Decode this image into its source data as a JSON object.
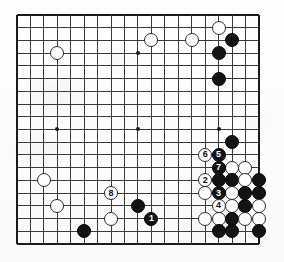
{
  "figure": {
    "type": "go-board-diagram",
    "board_size": 19,
    "visible_columns": 19,
    "visible_rows": 19,
    "colors": {
      "black_stone": "#131313",
      "white_stone": "#fdfdfd",
      "grid_line": "#3a3a3a",
      "board_edge": "#1a1a1a",
      "paper": "#fbfbfa"
    },
    "geometry": {
      "origin_x": 17,
      "origin_y": 15,
      "step_x": 13.44,
      "step_y": 12.72,
      "stone_diameter": 14
    },
    "star_points": [
      {
        "col": 3,
        "row": 3
      },
      {
        "col": 9,
        "row": 3
      },
      {
        "col": 15,
        "row": 3
      },
      {
        "col": 3,
        "row": 9
      },
      {
        "col": 9,
        "row": 9
      },
      {
        "col": 15,
        "row": 9
      },
      {
        "col": 3,
        "row": 15
      },
      {
        "col": 9,
        "row": 15
      },
      {
        "col": 15,
        "row": 15
      }
    ]
  },
  "move_numbers": {
    "1": "1",
    "2": "2",
    "3": "3",
    "4": "4",
    "5": "5",
    "6": "6",
    "7": "7",
    "8": "8"
  },
  "chart_data": {
    "type": "table",
    "xlabel": "column (0–18, left to right)",
    "ylabel": "row (0–18, top to bottom)",
    "legend": [
      "black stone",
      "white stone",
      "numbered move"
    ],
    "stones": [
      {
        "col": 3,
        "row": 3,
        "color": "white",
        "label": ""
      },
      {
        "col": 10,
        "row": 2,
        "color": "white",
        "label": ""
      },
      {
        "col": 13,
        "row": 2,
        "color": "white",
        "label": ""
      },
      {
        "col": 15,
        "row": 1,
        "color": "white",
        "label": ""
      },
      {
        "col": 16,
        "row": 2,
        "color": "black",
        "label": ""
      },
      {
        "col": 15,
        "row": 3,
        "color": "black",
        "label": ""
      },
      {
        "col": 15,
        "row": 5,
        "color": "black",
        "label": ""
      },
      {
        "col": 16,
        "row": 10,
        "color": "black",
        "label": ""
      },
      {
        "col": 15,
        "row": 11,
        "color": "black",
        "label": "5"
      },
      {
        "col": 14,
        "row": 11,
        "color": "white",
        "label": "6"
      },
      {
        "col": 15,
        "row": 12,
        "color": "black",
        "label": "7"
      },
      {
        "col": 16,
        "row": 12,
        "color": "white",
        "label": ""
      },
      {
        "col": 17,
        "row": 12,
        "color": "white",
        "label": ""
      },
      {
        "col": 14,
        "row": 13,
        "color": "white",
        "label": "2"
      },
      {
        "col": 15,
        "row": 13,
        "color": "black",
        "label": ""
      },
      {
        "col": 16,
        "row": 13,
        "color": "black",
        "label": ""
      },
      {
        "col": 17,
        "row": 13,
        "color": "white",
        "label": ""
      },
      {
        "col": 18,
        "row": 13,
        "color": "black",
        "label": ""
      },
      {
        "col": 14,
        "row": 14,
        "color": "white",
        "label": ""
      },
      {
        "col": 15,
        "row": 14,
        "color": "black",
        "label": "3"
      },
      {
        "col": 16,
        "row": 14,
        "color": "white",
        "label": ""
      },
      {
        "col": 17,
        "row": 14,
        "color": "black",
        "label": ""
      },
      {
        "col": 18,
        "row": 14,
        "color": "black",
        "label": ""
      },
      {
        "col": 15,
        "row": 15,
        "color": "white",
        "label": "4"
      },
      {
        "col": 16,
        "row": 15,
        "color": "white",
        "label": ""
      },
      {
        "col": 17,
        "row": 15,
        "color": "black",
        "label": ""
      },
      {
        "col": 18,
        "row": 15,
        "color": "white",
        "label": ""
      },
      {
        "col": 14,
        "row": 16,
        "color": "white",
        "label": ""
      },
      {
        "col": 15,
        "row": 16,
        "color": "white",
        "label": ""
      },
      {
        "col": 16,
        "row": 16,
        "color": "black",
        "label": ""
      },
      {
        "col": 17,
        "row": 16,
        "color": "white",
        "label": ""
      },
      {
        "col": 18,
        "row": 16,
        "color": "white",
        "label": ""
      },
      {
        "col": 15,
        "row": 17,
        "color": "black",
        "label": ""
      },
      {
        "col": 16,
        "row": 17,
        "color": "black",
        "label": ""
      },
      {
        "col": 18,
        "row": 17,
        "color": "black",
        "label": ""
      },
      {
        "col": 2,
        "row": 13,
        "color": "white",
        "label": ""
      },
      {
        "col": 3,
        "row": 15,
        "color": "white",
        "label": ""
      },
      {
        "col": 7,
        "row": 14,
        "color": "white",
        "label": "8"
      },
      {
        "col": 7,
        "row": 16,
        "color": "white",
        "label": ""
      },
      {
        "col": 5,
        "row": 17,
        "color": "black",
        "label": ""
      },
      {
        "col": 9,
        "row": 15,
        "color": "black",
        "label": ""
      },
      {
        "col": 10,
        "row": 16,
        "color": "black",
        "label": "1"
      }
    ]
  }
}
